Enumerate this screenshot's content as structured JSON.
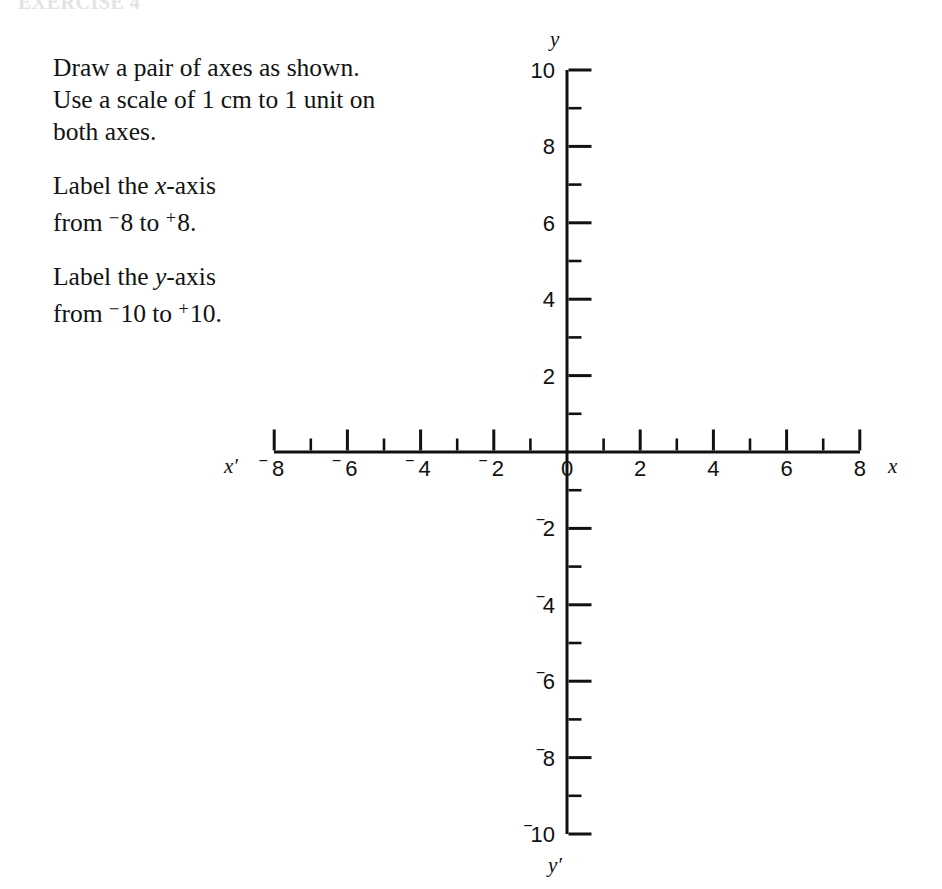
{
  "page": {
    "header_remnant": "EXERCISE 4",
    "background": "#ffffff",
    "ink_color": "#111111"
  },
  "instructions": [
    {
      "id": "draw-axes",
      "lines": [
        "Draw a pair of axes as shown.",
        "Use a scale of 1 cm to 1 unit on",
        "both axes."
      ]
    },
    {
      "id": "label-x-axis",
      "lines": [
        "Label the x-axis",
        "from ⁻8 to ⁺8."
      ],
      "line1_prefix": "Label the ",
      "line1_var": "x",
      "line1_suffix": "-axis",
      "line2_prefix": "from ",
      "line2_from_sign": "−",
      "line2_from_value": "8",
      "line2_middle": " to ",
      "line2_to_sign": "+",
      "line2_to_value": "8",
      "line2_end": "."
    },
    {
      "id": "label-y-axis",
      "lines": [
        "Label the y-axis",
        "from ⁻10 to ⁺10."
      ],
      "line1_prefix": "Label the ",
      "line1_var": "y",
      "line1_suffix": "-axis",
      "line2_prefix": "from ",
      "line2_from_sign": "−",
      "line2_from_value": "10",
      "line2_middle": " to ",
      "line2_to_sign": "+",
      "line2_to_value": "10",
      "line2_end": "."
    }
  ],
  "chart_data": {
    "type": "line",
    "title": "",
    "subtitle": "",
    "xlabel": "x",
    "ylabel": "y",
    "xlim": [
      -8,
      8
    ],
    "ylim": [
      -10,
      10
    ],
    "grid": false,
    "legend": null,
    "series": [],
    "x_axis": {
      "name": "x",
      "name_negative": "x′",
      "range": [
        -8,
        8
      ],
      "major_tick_step": 1,
      "labeled_step": 2,
      "tick_direction": "up",
      "labels_below_axis": true,
      "ticks": [
        {
          "value": -8,
          "label": "8",
          "sign": "−",
          "major": true
        },
        {
          "value": -7,
          "label": "",
          "sign": "",
          "major": false
        },
        {
          "value": -6,
          "label": "6",
          "sign": "−",
          "major": true
        },
        {
          "value": -5,
          "label": "",
          "sign": "",
          "major": false
        },
        {
          "value": -4,
          "label": "4",
          "sign": "−",
          "major": true
        },
        {
          "value": -3,
          "label": "",
          "sign": "",
          "major": false
        },
        {
          "value": -2,
          "label": "2",
          "sign": "−",
          "major": true
        },
        {
          "value": -1,
          "label": "",
          "sign": "",
          "major": false
        },
        {
          "value": 0,
          "label": "0",
          "sign": "",
          "major": false
        },
        {
          "value": 1,
          "label": "",
          "sign": "",
          "major": false
        },
        {
          "value": 2,
          "label": "2",
          "sign": "",
          "major": true
        },
        {
          "value": 3,
          "label": "",
          "sign": "",
          "major": false
        },
        {
          "value": 4,
          "label": "4",
          "sign": "",
          "major": true
        },
        {
          "value": 5,
          "label": "",
          "sign": "",
          "major": false
        },
        {
          "value": 6,
          "label": "6",
          "sign": "",
          "major": true
        },
        {
          "value": 7,
          "label": "",
          "sign": "",
          "major": false
        },
        {
          "value": 8,
          "label": "8",
          "sign": "",
          "major": true
        }
      ]
    },
    "y_axis": {
      "name": "y",
      "name_negative": "y′",
      "range": [
        -10,
        10
      ],
      "major_tick_step": 1,
      "labeled_step": 2,
      "tick_direction": "right",
      "labels_left_of_axis": true,
      "ticks": [
        {
          "value": 10,
          "label": "10",
          "sign": "",
          "major": true
        },
        {
          "value": 9,
          "label": "",
          "sign": "",
          "major": false
        },
        {
          "value": 8,
          "label": "8",
          "sign": "",
          "major": true
        },
        {
          "value": 7,
          "label": "",
          "sign": "",
          "major": false
        },
        {
          "value": 6,
          "label": "6",
          "sign": "",
          "major": true
        },
        {
          "value": 5,
          "label": "",
          "sign": "",
          "major": false
        },
        {
          "value": 4,
          "label": "4",
          "sign": "",
          "major": true
        },
        {
          "value": 3,
          "label": "",
          "sign": "",
          "major": false
        },
        {
          "value": 2,
          "label": "2",
          "sign": "",
          "major": true
        },
        {
          "value": 1,
          "label": "",
          "sign": "",
          "major": false
        },
        {
          "value": 0,
          "label": "",
          "sign": "",
          "major": false
        },
        {
          "value": -1,
          "label": "",
          "sign": "",
          "major": false
        },
        {
          "value": -2,
          "label": "2",
          "sign": "−",
          "major": true
        },
        {
          "value": -3,
          "label": "",
          "sign": "",
          "major": false
        },
        {
          "value": -4,
          "label": "4",
          "sign": "−",
          "major": true
        },
        {
          "value": -5,
          "label": "",
          "sign": "",
          "major": false
        },
        {
          "value": -6,
          "label": "6",
          "sign": "−",
          "major": true
        },
        {
          "value": -7,
          "label": "",
          "sign": "",
          "major": false
        },
        {
          "value": -8,
          "label": "8",
          "sign": "−",
          "major": true
        },
        {
          "value": -9,
          "label": "",
          "sign": "",
          "major": false
        },
        {
          "value": -10,
          "label": "10",
          "sign": "−",
          "major": true
        }
      ]
    }
  }
}
